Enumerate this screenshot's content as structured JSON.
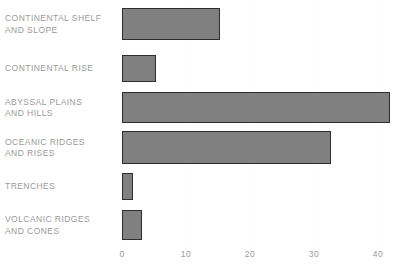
{
  "chart_data": {
    "type": "bar",
    "orientation": "horizontal",
    "title": "",
    "subtitle": "",
    "xlabel": "",
    "ylabel": "",
    "categories": [
      "CONTINENTAL SHELF\nAND SLOPE",
      "CONTINENTAL RISE",
      "ABYSSAL PLAINS\nAND HILLS",
      "OCEANIC RIDGES\nAND RISES",
      "TRENCHES",
      "VOLCANIC RIDGES\nAND CONES"
    ],
    "values": [
      15.3,
      5.3,
      41.8,
      32.7,
      1.7,
      3.1
    ],
    "xlim": [
      0,
      44
    ],
    "xticks": [
      0,
      10,
      20,
      30,
      40
    ],
    "xticklabels": [
      "0",
      "10",
      "20",
      "30",
      "40"
    ],
    "grid": true,
    "legend": false,
    "bar_color": "#808080",
    "bar_edge_color": "#2e2e2e",
    "text_color": "#9a9a9a",
    "gridline_color": "#fbfbfb",
    "background": "#ffffff"
  },
  "layout": {
    "plot_left_px": 122,
    "plot_width_px": 285,
    "px_per_unit": 6.4,
    "rows": [
      {
        "label_top": 8,
        "bar_top": 8,
        "bar_height": 32
      },
      {
        "label_top": 55,
        "bar_top": 55,
        "bar_height": 27
      },
      {
        "label_top": 92,
        "bar_top": 92,
        "bar_height": 31
      },
      {
        "label_top": 131,
        "bar_top": 131,
        "bar_height": 33
      },
      {
        "label_top": 173,
        "bar_top": 173,
        "bar_height": 27
      },
      {
        "label_top": 210,
        "bar_top": 210,
        "bar_height": 30
      }
    ]
  }
}
